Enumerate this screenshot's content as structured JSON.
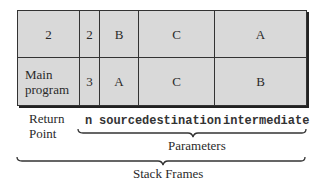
{
  "rows": [
    {
      "return_point": "2",
      "n": "2",
      "source": "B",
      "destination": "C",
      "intermediate": "A"
    },
    {
      "return_point": "Main program",
      "n": "3",
      "source": "A",
      "destination": "C",
      "intermediate": "B"
    }
  ],
  "labels": {
    "return_point": "Return Point",
    "n": "n",
    "source": "source",
    "destination": "destination",
    "intermediate": "intermediate",
    "parameters": "Parameters",
    "stack_frames": "Stack Frames"
  },
  "colors": {
    "cell_fill": "#d9d9d9",
    "border": "#333333"
  }
}
